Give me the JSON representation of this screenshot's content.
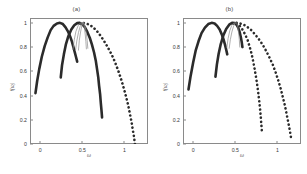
{
  "figure": {
    "background_color": "#ffffff",
    "curve_color": "#2b2b2b",
    "thin_curve_color": "#8d8d8d",
    "axis_color": "#8a8a8a"
  },
  "chart_data": [
    {
      "type": "line",
      "title": "(a)",
      "xlabel": "ω",
      "ylabel": "f(ω)",
      "xlim": [
        -0.12,
        1.28
      ],
      "ylim": [
        0,
        1.04
      ],
      "xticks": [
        0,
        0.5,
        1
      ],
      "xticklabels": [
        "0",
        "0.5",
        "1"
      ],
      "yticks": [
        0,
        0.2,
        0.4,
        0.6,
        0.8,
        1
      ],
      "yticklabels": [
        "0",
        "0.2",
        "0.4",
        "0.6",
        "0.8",
        "1"
      ],
      "grid": false,
      "legend": "none",
      "series": [
        {
          "name": "curve-1-solid-left",
          "style": "solid",
          "width": 2.6,
          "color": "#2b2b2b",
          "points": [
            [
              -0.055,
              0.42
            ],
            [
              -0.035,
              0.52
            ],
            [
              -0.01,
              0.62
            ],
            [
              0.02,
              0.72
            ],
            [
              0.055,
              0.81
            ],
            [
              0.09,
              0.88
            ],
            [
              0.125,
              0.94
            ],
            [
              0.16,
              0.975
            ],
            [
              0.2,
              0.995
            ],
            [
              0.235,
              1.0
            ],
            [
              0.27,
              0.99
            ],
            [
              0.3,
              0.965
            ],
            [
              0.33,
              0.93
            ],
            [
              0.355,
              0.89
            ],
            [
              0.375,
              0.85
            ],
            [
              0.395,
              0.8
            ],
            [
              0.41,
              0.76
            ],
            [
              0.425,
              0.72
            ],
            [
              0.44,
              0.68
            ]
          ]
        },
        {
          "name": "curve-2-solid-middle",
          "style": "solid",
          "width": 2.6,
          "color": "#2b2b2b",
          "points": [
            [
              0.245,
              0.55
            ],
            [
              0.26,
              0.65
            ],
            [
              0.282,
              0.74
            ],
            [
              0.305,
              0.82
            ],
            [
              0.335,
              0.89
            ],
            [
              0.37,
              0.945
            ],
            [
              0.405,
              0.98
            ],
            [
              0.44,
              0.998
            ],
            [
              0.47,
              1.0
            ],
            [
              0.5,
              0.99
            ],
            [
              0.53,
              0.965
            ],
            [
              0.56,
              0.925
            ],
            [
              0.59,
              0.875
            ],
            [
              0.615,
              0.82
            ],
            [
              0.64,
              0.755
            ],
            [
              0.66,
              0.69
            ],
            [
              0.675,
              0.62
            ],
            [
              0.69,
              0.55
            ],
            [
              0.7,
              0.48
            ],
            [
              0.712,
              0.41
            ],
            [
              0.72,
              0.34
            ],
            [
              0.728,
              0.28
            ],
            [
              0.735,
              0.22
            ]
          ]
        },
        {
          "name": "curve-3-dotted-right",
          "style": "dotted",
          "width": 2.6,
          "color": "#2b2b2b",
          "points": [
            [
              0.47,
              0.995
            ],
            [
              0.505,
              1.0
            ],
            [
              0.545,
              0.995
            ],
            [
              0.585,
              0.985
            ],
            [
              0.625,
              0.965
            ],
            [
              0.665,
              0.94
            ],
            [
              0.705,
              0.905
            ],
            [
              0.745,
              0.865
            ],
            [
              0.785,
              0.82
            ],
            [
              0.825,
              0.77
            ],
            [
              0.865,
              0.715
            ],
            [
              0.9,
              0.655
            ],
            [
              0.935,
              0.59
            ],
            [
              0.965,
              0.525
            ],
            [
              0.995,
              0.455
            ],
            [
              1.02,
              0.39
            ],
            [
              1.045,
              0.32
            ],
            [
              1.065,
              0.25
            ],
            [
              1.085,
              0.18
            ],
            [
              1.1,
              0.115
            ],
            [
              1.115,
              0.055
            ],
            [
              1.125,
              0.0
            ]
          ]
        },
        {
          "name": "thin-cluster-1",
          "style": "solid",
          "width": 0.7,
          "color": "#8d8d8d",
          "points": [
            [
              0.39,
              0.78
            ],
            [
              0.405,
              0.86
            ],
            [
              0.425,
              0.93
            ],
            [
              0.45,
              0.975
            ],
            [
              0.475,
              0.998
            ],
            [
              0.5,
              1.0
            ]
          ]
        },
        {
          "name": "thin-cluster-2",
          "style": "solid",
          "width": 0.7,
          "color": "#8d8d8d",
          "points": [
            [
              0.42,
              0.77
            ],
            [
              0.435,
              0.85
            ],
            [
              0.455,
              0.92
            ],
            [
              0.475,
              0.97
            ],
            [
              0.495,
              0.995
            ],
            [
              0.51,
              1.0
            ]
          ]
        },
        {
          "name": "thin-cluster-3",
          "style": "solid",
          "width": 0.7,
          "color": "#8d8d8d",
          "points": [
            [
              0.455,
              0.775
            ],
            [
              0.465,
              0.855
            ],
            [
              0.48,
              0.925
            ],
            [
              0.495,
              0.975
            ],
            [
              0.51,
              1.0
            ]
          ]
        },
        {
          "name": "thin-cluster-4",
          "style": "solid",
          "width": 0.7,
          "color": "#8d8d8d",
          "points": [
            [
              0.52,
              1.0
            ],
            [
              0.535,
              0.97
            ],
            [
              0.548,
              0.915
            ],
            [
              0.558,
              0.855
            ],
            [
              0.566,
              0.79
            ]
          ]
        },
        {
          "name": "thin-cluster-5",
          "style": "solid",
          "width": 0.7,
          "color": "#8d8d8d",
          "points": [
            [
              0.515,
              1.0
            ],
            [
              0.527,
              0.955
            ],
            [
              0.536,
              0.9
            ],
            [
              0.543,
              0.845
            ],
            [
              0.549,
              0.785
            ]
          ]
        }
      ]
    },
    {
      "type": "line",
      "title": "(b)",
      "xlabel": "ω",
      "ylabel": "f(ω)",
      "xlim": [
        -0.12,
        1.28
      ],
      "ylim": [
        0,
        1.04
      ],
      "xticks": [
        0,
        0.5,
        1
      ],
      "xticklabels": [
        "0",
        "0.5",
        "1"
      ],
      "yticks": [
        0,
        0.2,
        0.4,
        0.6,
        0.8,
        1
      ],
      "yticklabels": [
        "0",
        "0.2",
        "0.4",
        "0.6",
        "0.8",
        "1"
      ],
      "grid": false,
      "legend": "none",
      "series": [
        {
          "name": "curve-1-solid-left",
          "style": "solid",
          "width": 2.6,
          "color": "#2b2b2b",
          "points": [
            [
              -0.055,
              0.45
            ],
            [
              -0.03,
              0.56
            ],
            [
              0.0,
              0.67
            ],
            [
              0.03,
              0.77
            ],
            [
              0.065,
              0.85
            ],
            [
              0.1,
              0.915
            ],
            [
              0.14,
              0.96
            ],
            [
              0.18,
              0.99
            ],
            [
              0.22,
              1.0
            ],
            [
              0.255,
              0.995
            ],
            [
              0.285,
              0.975
            ],
            [
              0.315,
              0.945
            ],
            [
              0.34,
              0.905
            ],
            [
              0.36,
              0.865
            ],
            [
              0.378,
              0.82
            ],
            [
              0.392,
              0.78
            ],
            [
              0.405,
              0.74
            ]
          ]
        },
        {
          "name": "curve-2-solid-middle",
          "style": "solid",
          "width": 2.6,
          "color": "#2b2b2b",
          "points": [
            [
              0.265,
              0.555
            ],
            [
              0.282,
              0.655
            ],
            [
              0.303,
              0.745
            ],
            [
              0.328,
              0.825
            ],
            [
              0.358,
              0.895
            ],
            [
              0.392,
              0.95
            ],
            [
              0.428,
              0.985
            ],
            [
              0.462,
              1.0
            ],
            [
              0.492,
              0.998
            ],
            [
              0.515,
              0.985
            ],
            [
              0.535,
              0.96
            ],
            [
              0.552,
              0.925
            ],
            [
              0.565,
              0.885
            ],
            [
              0.576,
              0.845
            ],
            [
              0.585,
              0.8
            ]
          ]
        },
        {
          "name": "curve-3-dotted-right",
          "style": "dotted",
          "width": 2.6,
          "color": "#2b2b2b",
          "points": [
            [
              0.47,
              0.995
            ],
            [
              0.5,
              1.0
            ],
            [
              0.53,
              0.99
            ],
            [
              0.56,
              0.97
            ],
            [
              0.59,
              0.94
            ],
            [
              0.62,
              0.9
            ],
            [
              0.648,
              0.855
            ],
            [
              0.672,
              0.8
            ],
            [
              0.695,
              0.74
            ],
            [
              0.715,
              0.675
            ],
            [
              0.732,
              0.61
            ],
            [
              0.748,
              0.545
            ],
            [
              0.762,
              0.48
            ],
            [
              0.774,
              0.415
            ],
            [
              0.785,
              0.35
            ],
            [
              0.795,
              0.285
            ],
            [
              0.803,
              0.22
            ],
            [
              0.81,
              0.155
            ],
            [
              0.817,
              0.095
            ]
          ]
        },
        {
          "name": "curve-4-dotted-far-right",
          "style": "dotted",
          "width": 2.6,
          "color": "#2b2b2b",
          "points": [
            [
              0.515,
              1.0
            ],
            [
              0.555,
              0.995
            ],
            [
              0.6,
              0.985
            ],
            [
              0.645,
              0.965
            ],
            [
              0.69,
              0.94
            ],
            [
              0.735,
              0.905
            ],
            [
              0.78,
              0.865
            ],
            [
              0.825,
              0.82
            ],
            [
              0.865,
              0.77
            ],
            [
              0.905,
              0.715
            ],
            [
              0.945,
              0.655
            ],
            [
              0.98,
              0.59
            ],
            [
              1.01,
              0.525
            ],
            [
              1.04,
              0.455
            ],
            [
              1.065,
              0.385
            ],
            [
              1.09,
              0.315
            ],
            [
              1.11,
              0.245
            ],
            [
              1.13,
              0.175
            ],
            [
              1.148,
              0.11
            ],
            [
              1.162,
              0.05
            ]
          ]
        },
        {
          "name": "thin-cluster-1",
          "style": "solid",
          "width": 0.7,
          "color": "#8d8d8d",
          "points": [
            [
              0.4,
              0.795
            ],
            [
              0.415,
              0.87
            ],
            [
              0.435,
              0.935
            ],
            [
              0.458,
              0.978
            ],
            [
              0.482,
              0.998
            ],
            [
              0.5,
              1.0
            ]
          ]
        },
        {
          "name": "thin-cluster-2",
          "style": "solid",
          "width": 0.7,
          "color": "#8d8d8d",
          "points": [
            [
              0.428,
              0.79
            ],
            [
              0.442,
              0.862
            ],
            [
              0.46,
              0.925
            ],
            [
              0.48,
              0.972
            ],
            [
              0.5,
              0.998
            ]
          ]
        },
        {
          "name": "thin-cluster-3",
          "style": "solid",
          "width": 0.7,
          "color": "#8d8d8d",
          "points": [
            [
              0.518,
              1.0
            ],
            [
              0.53,
              0.965
            ],
            [
              0.54,
              0.915
            ],
            [
              0.548,
              0.86
            ],
            [
              0.554,
              0.8
            ]
          ]
        }
      ]
    }
  ]
}
